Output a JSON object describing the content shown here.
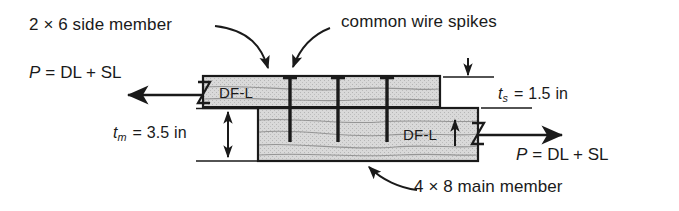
{
  "figure": {
    "type": "engineering-detail-drawing",
    "background_color": "#ffffff",
    "line_color": "#1a1a1a",
    "wood_fill_color": "#d4d4d4",
    "wood_grain_color": "#8c8c8c"
  },
  "callouts": {
    "side_member": "2 × 6 side member",
    "spikes": "common wire spikes",
    "main_member": "4 × 8 main member"
  },
  "loads": {
    "left": {
      "symbol": "P",
      "equals": "=",
      "expression": "DL + SL",
      "full": "P = DL + SL",
      "direction": "left"
    },
    "right": {
      "symbol": "P",
      "equals": "=",
      "expression": "DL + SL",
      "full": "P = DL + SL",
      "direction": "right"
    }
  },
  "dimensions": {
    "side_thickness": {
      "symbol": "t",
      "subscript": "s",
      "equals": "=",
      "value": "1.5",
      "unit": "in",
      "full": "t_s = 1.5 in"
    },
    "main_thickness": {
      "symbol": "t",
      "subscript": "m",
      "equals": "=",
      "value": "3.5",
      "unit": "in",
      "full": "t_m = 3.5 in"
    }
  },
  "species_labels": {
    "side_member": "DF-L",
    "main_member": "DF-L"
  },
  "break_symbols": {
    "left": "Z",
    "right": "Z"
  },
  "fasteners": {
    "label": "common wire spikes",
    "count": 3,
    "positions_px": [
      290,
      338,
      387
    ]
  },
  "geometry_px": {
    "side_member": {
      "x": 203,
      "y": 76,
      "width": 237,
      "height": 32
    },
    "main_member": {
      "x": 258,
      "y": 108,
      "width": 220,
      "height": 53
    }
  }
}
